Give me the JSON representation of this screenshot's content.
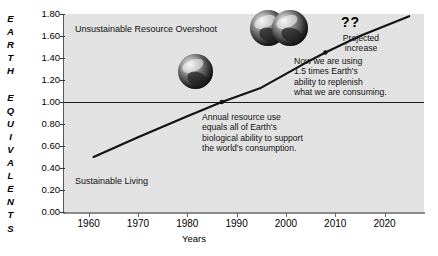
{
  "chart_data": {
    "type": "line",
    "title": "",
    "xlabel": "Years",
    "ylabel": "EARTH EQUIVALENTS",
    "xlim": [
      1955,
      2028
    ],
    "ylim": [
      0.0,
      1.8
    ],
    "grid": false,
    "legend": "none",
    "x_ticks": [
      "1960",
      "1970",
      "1980",
      "1990",
      "2000",
      "2010",
      "2020"
    ],
    "x_tick_values": [
      1960,
      1970,
      1980,
      1990,
      2000,
      2010,
      2020
    ],
    "y_ticks": [
      "0.00",
      "0.20",
      "0.40",
      "0.60",
      "0.80",
      "1.00",
      "1.20",
      "1.40",
      "1.60",
      "1.80"
    ],
    "y_tick_values": [
      0.0,
      0.2,
      0.4,
      0.6,
      0.8,
      1.0,
      1.2,
      1.4,
      1.6,
      1.8
    ],
    "series": [
      {
        "name": "Humanity's Ecological Footprint",
        "x": [
          1961,
          1970,
          1980,
          1987,
          1995,
          2005,
          2008,
          2015,
          2025
        ],
        "values": [
          0.5,
          0.68,
          0.87,
          1.0,
          1.13,
          1.38,
          1.45,
          1.6,
          1.78
        ]
      }
    ],
    "reference_line": {
      "value": 1.0,
      "label": "Earth's biocapacity"
    },
    "annotations": [
      {
        "name": "overshoot-region",
        "text": "Unsustainable Resource Overshoot"
      },
      {
        "name": "sustainable-region",
        "text": "Sustainable Living"
      },
      {
        "name": "crossing",
        "text": "Annual resource use equals all of Earth's biological ability to support the world's consumption."
      },
      {
        "name": "now",
        "text": "Now we are using 1.5 times Earth's ability to replenish what we are consuming."
      },
      {
        "name": "projected",
        "text": "Projected increase"
      },
      {
        "name": "question-marks",
        "text": "??"
      }
    ],
    "icons": [
      {
        "name": "earth-globe-one",
        "count": 1,
        "meaning": "one Earth at crossing point"
      },
      {
        "name": "earth-globe-one-and-half",
        "count": 2,
        "meaning": "1.5 Earths today"
      }
    ]
  },
  "axes": {
    "y_title_letters": [
      "E",
      "A",
      "R",
      "T",
      "H",
      "",
      "E",
      "Q",
      "U",
      "I",
      "V",
      "A",
      "L",
      "E",
      "N",
      "T",
      "S"
    ],
    "x_title": "Years"
  },
  "labels": {
    "overshoot": "Unsustainable Resource Overshoot",
    "sustainable": "Sustainable Living",
    "crossing_l1": "Annual resource use",
    "crossing_l2": "equals all of Earth's",
    "crossing_l3": "biological ability to support",
    "crossing_l4": "the world's consumption.",
    "now_l1": "Now we are using",
    "now_l2": "1.5 times Earth's",
    "now_l3": "ability to replenish",
    "now_l4": "what we are consuming.",
    "projected_l1": "Projected",
    "projected_l2": "increase",
    "question_marks": "??"
  },
  "colors": {
    "plot_background": "#e2e2e2",
    "page_background": "#ffffff",
    "line": "#111111",
    "axis": "#5a5a5a",
    "text": "#000000"
  }
}
